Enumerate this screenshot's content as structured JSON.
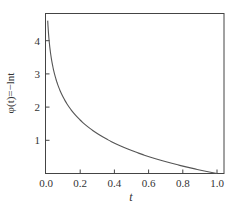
{
  "chart_data": {
    "type": "line",
    "title": "",
    "xlabel": "t",
    "ylabel": "φ(t)=−lnt",
    "xlim": [
      0.0,
      1.03
    ],
    "ylim": [
      0,
      4.85
    ],
    "xticks": [
      0.0,
      0.2,
      0.4,
      0.6,
      0.8,
      1.0
    ],
    "xtick_labels": [
      "0.0",
      "0.2",
      "0.4",
      "0.6",
      "0.8",
      "1.0"
    ],
    "yticks": [
      1,
      2,
      3,
      4
    ],
    "ytick_labels": [
      "1",
      "2",
      "3",
      "4"
    ],
    "grid": false,
    "legend": null,
    "series": [
      {
        "name": "φ(t)=−ln t",
        "function": "-ln(t)",
        "x": [
          0.01,
          0.02,
          0.03,
          0.05,
          0.075,
          0.1,
          0.15,
          0.2,
          0.3,
          0.4,
          0.5,
          0.6,
          0.7,
          0.8,
          0.9,
          1.0
        ],
        "y": [
          4.61,
          3.91,
          3.51,
          3.0,
          2.59,
          2.3,
          1.9,
          1.61,
          1.2,
          0.92,
          0.69,
          0.51,
          0.36,
          0.22,
          0.11,
          0.0
        ]
      }
    ],
    "colors": {
      "line": "#555555",
      "axes": "#444444",
      "text": "#333333"
    }
  }
}
